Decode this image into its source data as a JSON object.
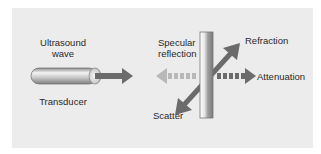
{
  "diagram": {
    "labels": {
      "ultrasound_wave_line1": "Ultrasound",
      "ultrasound_wave_line2": "wave",
      "transducer": "Transducer",
      "specular_reflection_line1": "Specular",
      "specular_reflection_line2": "reflection",
      "refraction": "Refraction",
      "attenuation": "Attenuation",
      "scatter": "Scatter"
    },
    "colors": {
      "panel": "#ececec",
      "arrow_dark": "#6b6b6b",
      "arrow_light": "#b8b8b8",
      "text": "#2a2a2a"
    }
  }
}
